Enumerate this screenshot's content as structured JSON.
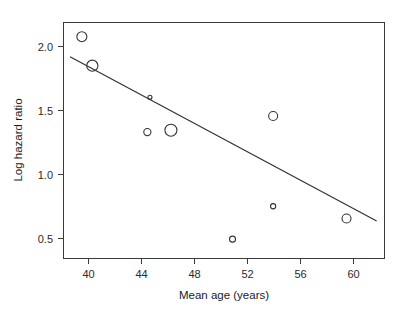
{
  "chart_data": {
    "type": "scatter",
    "title": "",
    "subtitle": "",
    "xlabel": "Mean age (years)",
    "ylabel": "Log hazard ratio",
    "xlim": [
      38.0,
      62.5
    ],
    "ylim": [
      0.35,
      2.18
    ],
    "xticks": [
      40,
      44,
      48,
      52,
      56,
      60
    ],
    "xticklabels": [
      "40",
      "44",
      "48",
      "52",
      "56",
      "60"
    ],
    "yticks": [
      0.5,
      1.0,
      1.5,
      2.0
    ],
    "yticklabels": [
      "0.5",
      "1.0",
      "1.5",
      "2.0"
    ],
    "grid": false,
    "legend": null,
    "marker_style": "open-circle",
    "marker_note": "bubble sizes vary by study weight",
    "points": [
      {
        "x": 39.4,
        "y": 2.07,
        "size": 5.0
      },
      {
        "x": 40.2,
        "y": 1.845,
        "size": 5.6
      },
      {
        "x": 44.6,
        "y": 1.6,
        "size": 2.0
      },
      {
        "x": 44.4,
        "y": 1.33,
        "size": 3.6
      },
      {
        "x": 46.2,
        "y": 1.345,
        "size": 6.0
      },
      {
        "x": 50.9,
        "y": 0.5,
        "size": 3.0
      },
      {
        "x": 54.0,
        "y": 1.455,
        "size": 4.5
      },
      {
        "x": 54.0,
        "y": 0.755,
        "size": 2.6
      },
      {
        "x": 59.6,
        "y": 0.66,
        "size": 4.5
      }
    ],
    "series": [
      {
        "name": "study estimates",
        "x": [
          39.4,
          40.2,
          44.6,
          44.4,
          46.2,
          50.9,
          54.0,
          54.0,
          59.6
        ],
        "values": [
          2.07,
          1.845,
          1.6,
          1.33,
          1.345,
          0.5,
          1.455,
          0.755,
          0.66
        ]
      }
    ],
    "fit_line": {
      "name": "meta-regression fit",
      "x_start": 38.5,
      "y_start": 1.915,
      "x_end": 61.9,
      "y_end": 0.64
    },
    "colors": {
      "axis": "#3a3a3a",
      "marker": "#333333",
      "line": "#2e2e2e",
      "text": "#1c1c1c",
      "background": "#ffffff"
    }
  }
}
